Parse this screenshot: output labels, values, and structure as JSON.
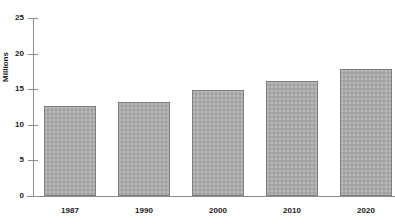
{
  "chart_data": {
    "type": "bar",
    "title": "",
    "subtitle": "",
    "xlabel": "",
    "ylabel": "Millions",
    "categories": [
      "1987",
      "1990",
      "2000",
      "2010",
      "2020"
    ],
    "values": [
      12.6,
      13.2,
      14.9,
      16.1,
      17.9
    ],
    "series": [
      {
        "name": "Millions",
        "values": [
          12.6,
          13.2,
          14.9,
          16.1,
          17.9
        ]
      }
    ],
    "ylim": [
      0,
      25
    ],
    "yticks": [
      0,
      5,
      10,
      15,
      20,
      25
    ],
    "ytick_labels": [
      "0",
      "5",
      "10",
      "15",
      "20",
      "25"
    ],
    "grid": false,
    "legend": false,
    "legend_position": "none",
    "bar_fill_color": "#a9a9a9",
    "bar_border_color": "#7d7d7d",
    "axis_color": "#8e8e8e",
    "text_color": "#1a1a1a",
    "background_color": "#ffffff"
  },
  "axes": {
    "y_title": "Millions",
    "ticks": [
      {
        "label": "25",
        "value": 25
      },
      {
        "label": "20",
        "value": 20
      },
      {
        "label": "15",
        "value": 15
      },
      {
        "label": "10",
        "value": 10
      },
      {
        "label": "5",
        "value": 5
      },
      {
        "label": "0",
        "value": 0
      }
    ]
  },
  "bars": [
    {
      "category": "1987",
      "value": 12.6
    },
    {
      "category": "1990",
      "value": 13.2
    },
    {
      "category": "2000",
      "value": 14.9
    },
    {
      "category": "2010",
      "value": 16.1
    },
    {
      "category": "2020",
      "value": 17.9
    }
  ]
}
